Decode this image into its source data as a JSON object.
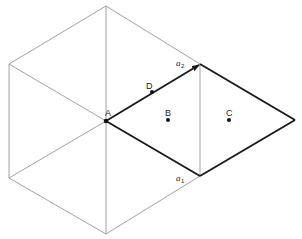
{
  "diagram": {
    "type": "hexagonal lattice cell",
    "colors": {
      "thin_line": "#8a8a8a",
      "thick_line": "#1a1a1a",
      "background": "#ffffff"
    },
    "labels": {
      "A": "A",
      "B": "B",
      "C": "C",
      "D": "D",
      "a1_main": "a",
      "a1_sub": "1",
      "a2_main": "a",
      "a2_sub": "2"
    },
    "points": {
      "A": [
        106,
        121
      ],
      "B": [
        168,
        120
      ],
      "C": [
        229,
        120
      ],
      "D": [
        152,
        92
      ]
    },
    "vectors": [
      {
        "name": "a1",
        "from": [
          106,
          121
        ],
        "to": [
          200,
          176
        ]
      },
      {
        "name": "a2",
        "from": [
          106,
          121
        ],
        "to": [
          200,
          64
        ],
        "arrowhead": true
      }
    ],
    "hexagon_vertices": [
      [
        106,
        6
      ],
      [
        200,
        64
      ],
      [
        200,
        176
      ],
      [
        106,
        234
      ],
      [
        9,
        178
      ],
      [
        9,
        64
      ]
    ],
    "unit_cell_rhombus": [
      [
        106,
        121
      ],
      [
        200,
        64
      ],
      [
        295,
        120
      ],
      [
        200,
        176
      ]
    ]
  }
}
